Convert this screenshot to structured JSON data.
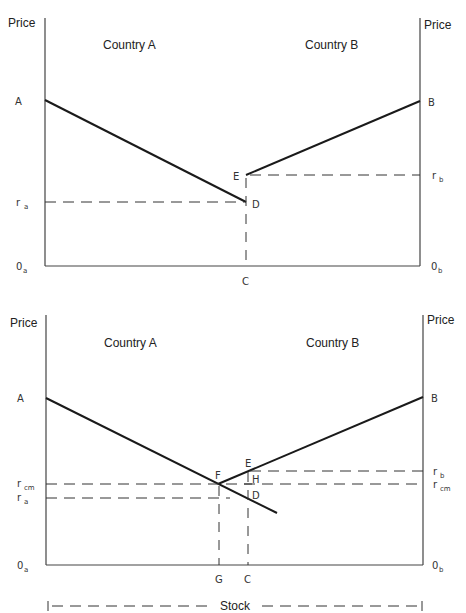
{
  "panels": [
    {
      "id": "before",
      "left_axis_label": "Price",
      "right_axis_label": "Price",
      "left_region_label": "Country A",
      "right_region_label": "Country B",
      "point_labels": {
        "A": "A",
        "B": "B",
        "E": "E",
        "D": "D",
        "C": "C"
      },
      "rate_labels": {
        "ra_main": "r",
        "ra_sub": "a",
        "rb_main": "r",
        "rb_sub": "b"
      },
      "origin_labels": {
        "oa_main": "0",
        "oa_sub": "a",
        "ob_main": "0",
        "ob_sub": "b"
      }
    },
    {
      "id": "after",
      "left_axis_label": "Price",
      "right_axis_label": "Price",
      "left_region_label": "Country A",
      "right_region_label": "Country B",
      "point_labels": {
        "A": "A",
        "B": "B",
        "E": "E",
        "F": "F",
        "H": "H",
        "D": "D",
        "G": "G",
        "C": "C"
      },
      "rate_labels": {
        "rcm_main": "r",
        "rcm_sub": "cm",
        "ra_main": "r",
        "ra_sub": "a",
        "rb_main": "r",
        "rb_sub": "b",
        "rcm2_main": "r",
        "rcm2_sub": "cm"
      },
      "origin_labels": {
        "oa_main": "0",
        "oa_sub": "a",
        "ob_main": "0",
        "ob_sub": "b"
      },
      "stock_label": "Stock"
    }
  ]
}
